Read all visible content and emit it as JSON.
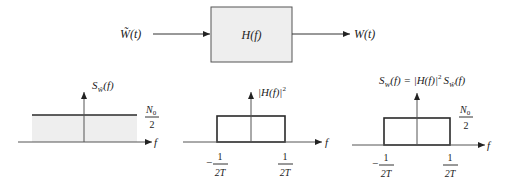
{
  "block_diagram": {
    "input_label": "W̃(t)",
    "system_label": "H(f)",
    "output_label": "W(t)",
    "box_fill": "#eeeeee",
    "box_stroke": "#555555"
  },
  "plots": [
    {
      "id": "input-psd",
      "y_label": "SW̃(f)",
      "y_label_main": "S",
      "y_label_sub": "W̃",
      "y_label_arg": "(f)",
      "x_label": "f",
      "level_num": "N",
      "level_num_sub": "0",
      "level_den": "2",
      "shape": "flat",
      "fill": "#eeeeee"
    },
    {
      "id": "filter-response",
      "y_label": "|H(f)|²",
      "y_label_main": "|H(f)|",
      "y_label_sup": "2",
      "x_label": "f",
      "tick_left_num": "1",
      "tick_left_den": "2T",
      "tick_left_sign": "−",
      "tick_right_num": "1",
      "tick_right_den": "2T",
      "shape": "rect",
      "fill": "#ffffff"
    },
    {
      "id": "output-psd",
      "y_label": "SW(f) = |H(f)|² SW̃(f)",
      "y_label_lhs_main": "S",
      "y_label_lhs_sub": "W",
      "y_label_lhs_arg": "(f) = |H(f)|",
      "y_label_sup": "2",
      "y_label_rhs_main": "S",
      "y_label_rhs_sub": "W̃",
      "y_label_rhs_arg": "(f)",
      "x_label": "f",
      "level_num": "N",
      "level_num_sub": "0",
      "level_den": "2",
      "tick_left_num": "1",
      "tick_left_den": "2T",
      "tick_left_sign": "−",
      "tick_right_num": "1",
      "tick_right_den": "2T",
      "shape": "rect",
      "fill": "#eeeeee"
    }
  ]
}
